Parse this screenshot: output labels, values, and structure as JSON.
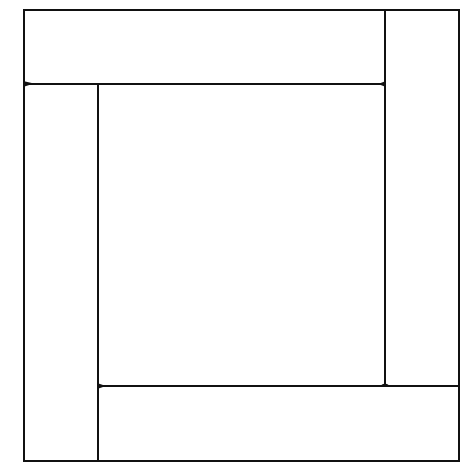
{
  "diagram": {
    "stroke_color": "#111111",
    "background_color": "#ffffff",
    "shapes": {
      "top_bar": {
        "x": 24,
        "y": 10,
        "w": 361,
        "h": 74
      },
      "right_bar": {
        "x": 385,
        "y": 10,
        "w": 74,
        "h": 376
      },
      "bottom_bar": {
        "x": 98,
        "y": 386,
        "w": 361,
        "h": 75
      },
      "left_bar": {
        "x": 24,
        "y": 84,
        "w": 74,
        "h": 377
      },
      "center_square": {
        "x": 98,
        "y": 84,
        "w": 287,
        "h": 302
      }
    }
  }
}
